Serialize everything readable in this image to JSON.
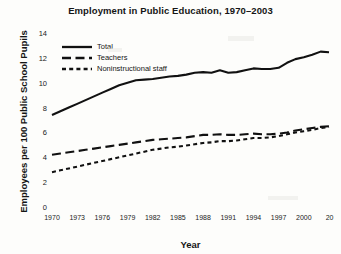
{
  "chart_data": {
    "type": "line",
    "title": "Employment in Public Education, 1970–2003",
    "xlabel": "Year",
    "ylabel": "Employees per 100 Public School Pupils",
    "xlim": [
      1970,
      2003
    ],
    "ylim": [
      0,
      14
    ],
    "grid": false,
    "legend_position": "upper-left inside plot",
    "ytick_labels": [
      "0",
      "2",
      "4",
      "6",
      "8",
      "10",
      "12",
      "14"
    ],
    "ytick_values": [
      0,
      2,
      4,
      6,
      8,
      10,
      12,
      14
    ],
    "xtick_labels": [
      "1970",
      "1973",
      "1976",
      "1979",
      "1982",
      "1985",
      "1988",
      "1991",
      "1994",
      "1997",
      "2000",
      "20"
    ],
    "xtick_values": [
      1970,
      1973,
      1976,
      1979,
      1982,
      1985,
      1988,
      1991,
      1994,
      1997,
      2000,
      2003
    ],
    "xtick_note": "final label clipped at plot edge, reads '20' for 2003",
    "x": [
      1970,
      1971,
      1972,
      1973,
      1974,
      1975,
      1976,
      1977,
      1978,
      1979,
      1980,
      1981,
      1982,
      1983,
      1984,
      1985,
      1986,
      1987,
      1988,
      1989,
      1990,
      1991,
      1992,
      1993,
      1994,
      1995,
      1996,
      1997,
      1998,
      1999,
      2000,
      2001,
      2002,
      2003
    ],
    "series": [
      {
        "name": "Total",
        "style": "solid",
        "color": "#111111",
        "values": [
          7.4,
          7.7,
          8.0,
          8.3,
          8.6,
          8.9,
          9.2,
          9.5,
          9.8,
          10.0,
          10.2,
          10.25,
          10.3,
          10.4,
          10.5,
          10.55,
          10.65,
          10.8,
          10.85,
          10.8,
          11.0,
          10.8,
          10.85,
          11.0,
          11.15,
          11.1,
          11.1,
          11.2,
          11.6,
          11.9,
          12.05,
          12.25,
          12.5,
          12.45
        ]
      },
      {
        "name": "Teachers",
        "style": "dashed",
        "color": "#111111",
        "values": [
          4.2,
          4.3,
          4.4,
          4.5,
          4.6,
          4.7,
          4.8,
          4.9,
          5.0,
          5.1,
          5.2,
          5.3,
          5.4,
          5.45,
          5.5,
          5.55,
          5.6,
          5.7,
          5.8,
          5.8,
          5.85,
          5.8,
          5.8,
          5.85,
          5.9,
          5.85,
          5.85,
          5.9,
          6.0,
          6.15,
          6.25,
          6.35,
          6.45,
          6.5
        ]
      },
      {
        "name": "Noninstructional staff",
        "style": "dotted",
        "color": "#111111",
        "values": [
          2.8,
          2.95,
          3.1,
          3.25,
          3.4,
          3.55,
          3.7,
          3.85,
          4.0,
          4.15,
          4.3,
          4.45,
          4.6,
          4.7,
          4.8,
          4.85,
          4.95,
          5.05,
          5.15,
          5.2,
          5.3,
          5.3,
          5.35,
          5.45,
          5.55,
          5.55,
          5.6,
          5.7,
          5.85,
          6.0,
          6.1,
          6.2,
          6.35,
          6.45
        ]
      }
    ]
  }
}
